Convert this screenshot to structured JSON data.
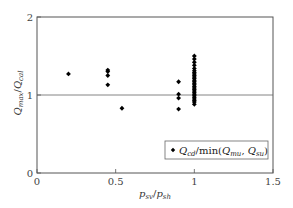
{
  "chart_data": {
    "type": "scatter",
    "title": "",
    "xlabel": {
      "main": "p",
      "sub1": "sv",
      "sep": "/",
      "main2": "p",
      "sub2": "sh"
    },
    "ylabel": {
      "main": "Q",
      "sub1": "max",
      "sep": "/",
      "main2": "Q",
      "sub2": "cal"
    },
    "xlim": [
      0,
      1.5
    ],
    "ylim": [
      0,
      2
    ],
    "xticks": [
      0,
      0.5,
      1,
      1.5
    ],
    "xtick_labels": [
      "0",
      "0.5",
      "1",
      "1.5"
    ],
    "yticks": [
      0,
      1,
      2
    ],
    "ytick_labels": [
      "0",
      "1",
      "2"
    ],
    "reference_line_y": 1,
    "grid": false,
    "legend": {
      "placement": "lower-right",
      "entries": [
        {
          "marker": "diamond",
          "label_parts": [
            "Q",
            "cd",
            "/min(",
            "Q",
            "mu",
            ", ",
            "Q",
            "su",
            ")"
          ]
        }
      ]
    },
    "series": [
      {
        "name": "Q_cd/min(Q_mu, Q_su)",
        "marker": "diamond",
        "color": "#000000",
        "points": [
          [
            0.2,
            1.27
          ],
          [
            0.45,
            1.32
          ],
          [
            0.45,
            1.3
          ],
          [
            0.45,
            1.25
          ],
          [
            0.45,
            1.13
          ],
          [
            0.54,
            0.83
          ],
          [
            0.9,
            1.17
          ],
          [
            0.9,
            1.01
          ],
          [
            0.9,
            0.96
          ],
          [
            0.9,
            0.82
          ],
          [
            1.0,
            1.5
          ],
          [
            1.0,
            1.46
          ],
          [
            1.0,
            1.42
          ],
          [
            1.0,
            1.38
          ],
          [
            1.0,
            1.34
          ],
          [
            1.0,
            1.31
          ],
          [
            1.0,
            1.29
          ],
          [
            1.0,
            1.27
          ],
          [
            1.0,
            1.25
          ],
          [
            1.0,
            1.23
          ],
          [
            1.0,
            1.21
          ],
          [
            1.0,
            1.19
          ],
          [
            1.0,
            1.17
          ],
          [
            1.0,
            1.15
          ],
          [
            1.0,
            1.13
          ],
          [
            1.0,
            1.11
          ],
          [
            1.0,
            1.09
          ],
          [
            1.0,
            1.07
          ],
          [
            1.0,
            1.05
          ],
          [
            1.0,
            1.03
          ],
          [
            1.0,
            1.01
          ],
          [
            1.0,
            0.99
          ],
          [
            1.0,
            0.97
          ],
          [
            1.0,
            0.95
          ],
          [
            1.0,
            0.93
          ],
          [
            1.0,
            0.91
          ],
          [
            1.0,
            0.88
          ]
        ]
      }
    ]
  }
}
